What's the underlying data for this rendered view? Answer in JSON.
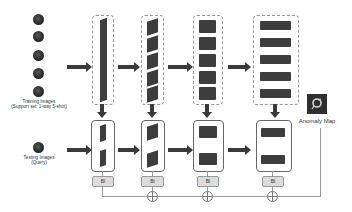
{
  "diagram": {
    "training": {
      "label_line1": "Training Images",
      "label_line2": "(Support set: 1-way 5-shot)",
      "count": 5
    },
    "testing": {
      "label_line1": "Testing Images",
      "label_line2": "(Query)"
    },
    "stages": [
      {
        "name": "stage-1",
        "block_label": "Bl"
      },
      {
        "name": "stage-2",
        "block_label": "Bl"
      },
      {
        "name": "stage-3",
        "block_label": "Bl"
      },
      {
        "name": "stage-4",
        "block_label": "Bl"
      }
    ],
    "output": {
      "label": "Anomaly Map"
    },
    "colors": {
      "block": "#3d3d3d",
      "arrow": "#3a3a3a",
      "bl_fill": "#dcdcdc"
    }
  }
}
